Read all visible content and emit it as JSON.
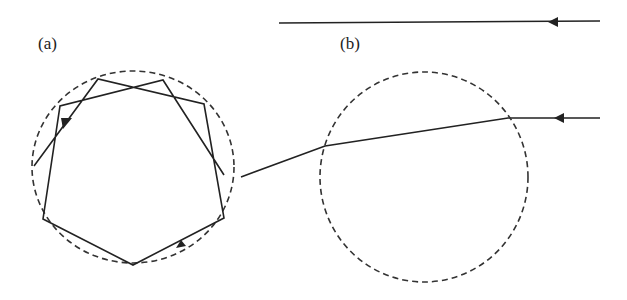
{
  "labels": {
    "a": "(a)",
    "b": "(b)"
  },
  "colors": {
    "stroke": "#222222",
    "background": "#ffffff"
  },
  "panels": [
    {
      "id": "a",
      "description": "Ray trapped inside circle by repeated reflections forming star polygon",
      "circle": {
        "cx": 133,
        "cy": 167,
        "rx": 101,
        "ry": 96,
        "style": "dashed"
      }
    },
    {
      "id": "b",
      "description": "Ray refracted through circle boundary, compared with straight reference ray",
      "circle": {
        "cx": 424,
        "cy": 177,
        "rx": 104,
        "ry": 105,
        "style": "dashed"
      }
    }
  ]
}
